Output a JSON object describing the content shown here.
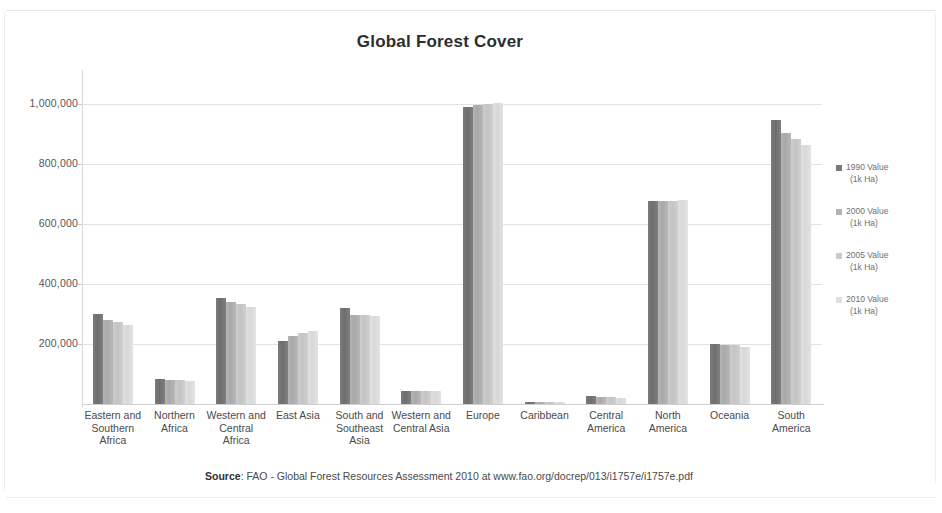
{
  "chart_data": {
    "type": "bar",
    "title": "Global Forest Cover",
    "xlabel": "",
    "ylabel": "",
    "ylim": [
      0,
      1100000
    ],
    "grid": true,
    "legend_position": "right",
    "ytick_labels": [
      "1,000,000",
      "800,000",
      "600,000",
      "400,000",
      "200,000"
    ],
    "ytick_values": [
      1000000,
      800000,
      600000,
      400000,
      200000
    ],
    "categories": [
      "Eastern and Southern Africa",
      "Northern Africa",
      "Western and Central Africa",
      "East Asia",
      "South and Southeast Asia",
      "Western and Central Asia",
      "Europe",
      "Caribbean",
      "Central America",
      "North America",
      "Oceania",
      "South America"
    ],
    "series": [
      {
        "name": "1990 Value (1k Ha)",
        "color": "#7a7a7a",
        "values": [
          300000,
          85000,
          352000,
          209000,
          320000,
          43000,
          989000,
          5900,
          26000,
          677000,
          201000,
          946000
        ]
      },
      {
        "name": "2000 Value (1k Ha)",
        "color": "#b2b2b2",
        "values": [
          281000,
          80000,
          339000,
          227000,
          298000,
          43000,
          998000,
          6200,
          23000,
          677000,
          198000,
          904000
        ]
      },
      {
        "name": "2005 Value (1k Ha)",
        "color": "#cbcbcb",
        "values": [
          272000,
          79000,
          332000,
          237000,
          296000,
          43000,
          1000000,
          6600,
          22000,
          677000,
          196000,
          882000
        ]
      },
      {
        "name": "2010 Value (1k Ha)",
        "color": "#e0e0e0",
        "values": [
          263000,
          78000,
          325000,
          243000,
          294000,
          43000,
          1005000,
          6900,
          20000,
          679000,
          191000,
          864000
        ]
      }
    ],
    "annotations": []
  },
  "legend": {
    "items": [
      {
        "line1": "1990 Value",
        "line2": "(1k Ha)"
      },
      {
        "line1": "2000 Value",
        "line2": "(1k Ha)"
      },
      {
        "line1": "2005 Value",
        "line2": "(1k Ha)"
      },
      {
        "line1": "2010 Value",
        "line2": "(1k Ha)"
      }
    ]
  },
  "source": {
    "label": "Source",
    "text": ": FAO - Global Forest Resources Assessment 2010 at www.fao.org/docrep/013/i1757e/i1757e.pdf"
  }
}
